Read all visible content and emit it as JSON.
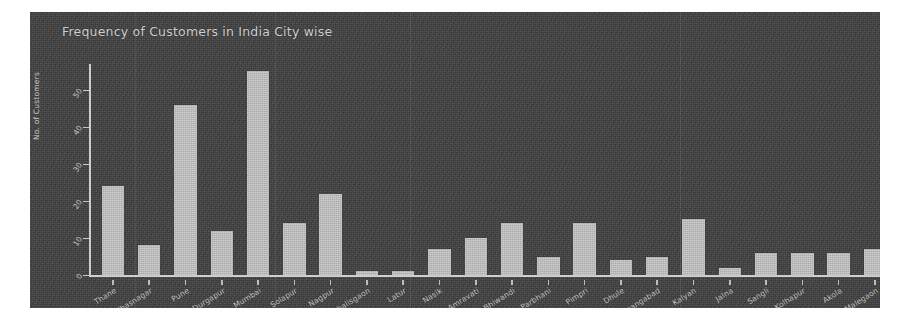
{
  "chart_data": {
    "type": "bar",
    "title": "Frequency of Customers in India City wise",
    "xlabel": "",
    "ylabel": "No. of Customers",
    "ylim": [
      0,
      57
    ],
    "yticks": [
      0,
      10,
      20,
      30,
      40,
      50
    ],
    "grid": false,
    "legend": null,
    "bar_color": "#c2c2c2",
    "background_color": "#3b3b3b",
    "text_color": "#cacaca",
    "categories": [
      "Thane",
      "Ulhasnagar",
      "Pune",
      "Durgapur",
      "Mumbai",
      "Solapur",
      "Nagpur",
      "Chalisgaon",
      "Latur",
      "Nasik",
      "Amravati",
      "Bhiwandi",
      "Parbhani",
      "Pimpri",
      "Dhule",
      "Aurangabad",
      "Kalyan",
      "Jalna",
      "Sangli",
      "Kolhapur",
      "Akola",
      "Malegaon"
    ],
    "values": [
      24,
      8,
      46,
      12,
      55,
      14,
      22,
      1,
      1,
      7,
      10,
      14,
      5,
      14,
      4,
      5,
      15,
      2,
      6,
      6,
      6,
      7
    ]
  }
}
